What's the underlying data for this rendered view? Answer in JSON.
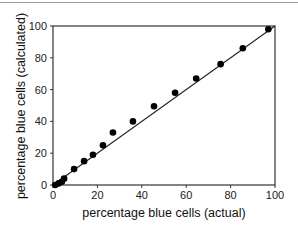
{
  "chart_data": {
    "type": "scatter",
    "title": "",
    "xlabel": "percentage blue cells (actual)",
    "ylabel": "percentage blue cells (calculated)",
    "xlim": [
      0,
      100
    ],
    "ylim": [
      0,
      100
    ],
    "xticks": [
      "0",
      "20",
      "40",
      "60",
      "80",
      "100"
    ],
    "yticks": [
      "0",
      "20",
      "40",
      "60",
      "80",
      "100"
    ],
    "grid": false,
    "legend": null,
    "series": [
      {
        "name": "measurements",
        "x": [
          1,
          2.5,
          4,
          5,
          9.5,
          14,
          18,
          22.5,
          27,
          36,
          45.5,
          55,
          64.5,
          75.5,
          85.5,
          97
        ],
        "y": [
          0,
          1,
          2,
          4,
          10,
          15,
          19,
          25,
          33,
          40,
          49.5,
          58,
          67,
          76,
          86,
          98
        ]
      }
    ],
    "fit_line": {
      "name": "y = x",
      "x": [
        0,
        100
      ],
      "y": [
        0,
        100
      ]
    }
  }
}
